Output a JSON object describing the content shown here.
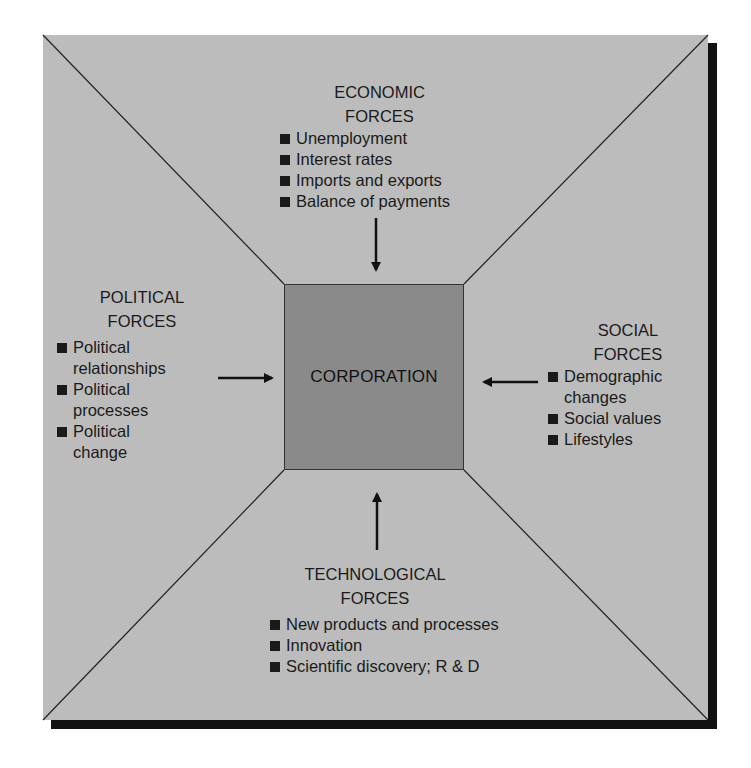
{
  "diagram": {
    "center": {
      "label": "CORPORATION"
    },
    "colors": {
      "frame": "#bcbcbc",
      "core": "#8a8a8a",
      "shadow": "#111111",
      "text": "#1a1a1a"
    },
    "economic": {
      "title_line1": "ECONOMIC",
      "title_line2": "FORCES",
      "items": [
        "Unemployment",
        "Interest rates",
        "Imports and exports",
        "Balance of payments"
      ],
      "arrow": "down"
    },
    "political": {
      "title_line1": "POLITICAL",
      "title_line2": "FORCES",
      "items": [
        {
          "line1": "Political",
          "line2": "relationships"
        },
        {
          "line1": "Political",
          "line2": "processes"
        },
        {
          "line1": "Political",
          "line2": "change"
        }
      ],
      "arrow": "right"
    },
    "social": {
      "title_line1": "SOCIAL",
      "title_line2": "FORCES",
      "items": [
        {
          "line1": "Demographic",
          "line2": "changes"
        },
        {
          "line1": "Social values",
          "line2": ""
        },
        {
          "line1": "Lifestyles",
          "line2": ""
        }
      ],
      "arrow": "left"
    },
    "technological": {
      "title_line1": "TECHNOLOGICAL",
      "title_line2": "FORCES",
      "items": [
        "New products and processes",
        "Innovation",
        "Scientific discovery; R & D"
      ],
      "arrow": "up"
    }
  }
}
